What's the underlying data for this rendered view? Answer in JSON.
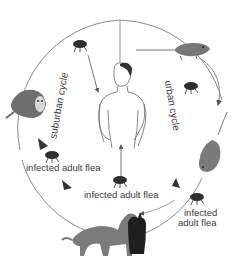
{
  "diagram": {
    "type": "transmission cycle",
    "labels": {
      "suburban_cycle": "suburban cycle",
      "urban_cycle": "urban cycle",
      "flea_left": "infected adult flea",
      "flea_bottom": "infected adult flea",
      "flea_right_line1": "infected",
      "flea_right_line2": "adult flea"
    },
    "nodes": [
      {
        "id": "human",
        "icon": "human-figure-icon"
      },
      {
        "id": "opossum",
        "icon": "opossum-icon"
      },
      {
        "id": "rat_top",
        "icon": "rat-icon"
      },
      {
        "id": "rat_right",
        "icon": "rat-icon"
      },
      {
        "id": "dog",
        "icon": "dog-icon"
      },
      {
        "id": "cat",
        "icon": "cat-icon"
      },
      {
        "id": "fleas",
        "icon": "flea-icon",
        "count": 5
      }
    ],
    "colors": {
      "line": "#8a8a8a",
      "animal": "#7a7a7a",
      "cat": "#1e1e1e",
      "text": "#3a3a3a"
    }
  }
}
